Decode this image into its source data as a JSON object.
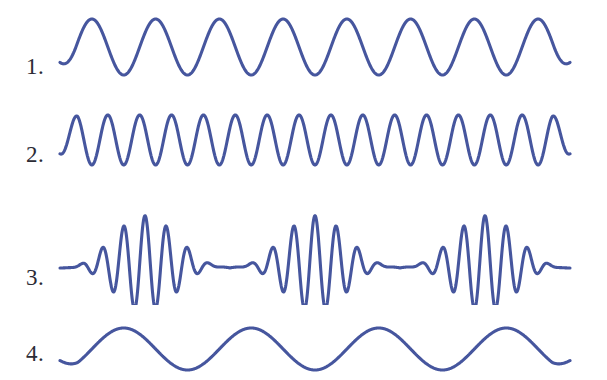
{
  "figure": {
    "background_color": "#ffffff",
    "width": 607,
    "height": 380,
    "stroke_color": "#46569e",
    "label_color": "#2b2b35"
  },
  "labels": {
    "row1": "1.",
    "row2": "2.",
    "row3": "3.",
    "row4": "4."
  },
  "chart_data": {
    "type": "line",
    "subtitle": "",
    "xlabel": "",
    "ylabel": "",
    "grid": false,
    "legend": "none",
    "axis_visible": false,
    "x": {
      "min": 0,
      "max": 1,
      "unit": "normalized position"
    },
    "series": [
      {
        "name": "1.",
        "label": "1.",
        "waveform": "sine",
        "cycles": 8,
        "amplitude": 28,
        "baseline_y": 47,
        "phase_deg": 180,
        "stroke_color": "#46569e",
        "stroke_width": 3.1,
        "x_start": 60,
        "x_end": 570,
        "description": "Uniform sinusoid, eight full cycles, moderate amplitude"
      },
      {
        "name": "2.",
        "label": "2.",
        "waveform": "sine",
        "cycles": 16,
        "amplitude": 25,
        "baseline_y": 140,
        "phase_deg": 180,
        "stroke_color": "#46569e",
        "stroke_width": 3.1,
        "x_start": 60,
        "x_end": 570,
        "description": "Uniform sinusoid, sixteen full cycles, double the frequency of trace 1"
      },
      {
        "name": "3.",
        "label": "3.",
        "waveform": "beat",
        "carrier_cycles": 24,
        "envelope_cycles": 3,
        "amplitude": 48,
        "baseline_y": 268,
        "packets": 3,
        "stroke_color": "#46569e",
        "stroke_width": 3.1,
        "x_start": 60,
        "x_end": 570,
        "description": "Beat pattern: high-frequency carrier modulated by a slow envelope producing three wave packets"
      },
      {
        "name": "4.",
        "label": "4.",
        "waveform": "sine",
        "cycles": 4,
        "amplitude": 21,
        "baseline_y": 349,
        "phase_deg": 180,
        "stroke_color": "#46569e",
        "stroke_width": 3.1,
        "x_start": 60,
        "x_end": 570,
        "description": "Low-frequency sinusoid, four full cycles, smallest amplitude"
      }
    ]
  }
}
